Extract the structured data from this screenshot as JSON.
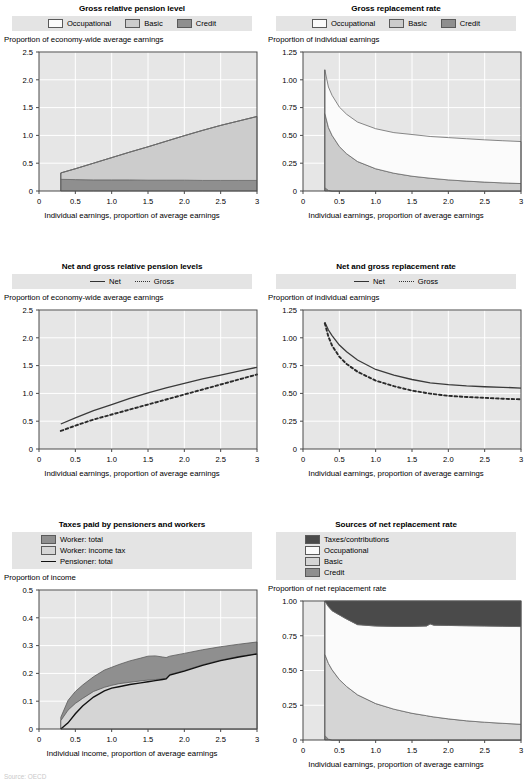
{
  "colors": {
    "legend_bg": "#e4e4e4",
    "plot_bg": "#e6e6e6",
    "gridline": "#ffffff",
    "axis": "#4a4a4a",
    "occupational": "#fbfbfb",
    "basic": "#cccccc",
    "credit": "#8f8f8f",
    "taxes_contributions": "#4a4a4a",
    "worker_total": "#8f8f8f",
    "worker_income_tax": "#d5d5d5",
    "pensioner_total": "#111111",
    "net_line": "#3a3a3a",
    "gross_line": "#2a2a2a"
  },
  "panels": [
    {
      "id": "gross-relative-pension-level",
      "title": "Gross relative pension level",
      "ylabel": "Proportion of economy-wide average earnings",
      "xlabel": "Individual earnings, proportion of average earnings",
      "legend": [
        {
          "label": "Occupational",
          "type": "swatch",
          "color": "#fbfbfb"
        },
        {
          "label": "Basic",
          "type": "swatch",
          "color": "#cccccc"
        },
        {
          "label": "Credit",
          "type": "swatch",
          "color": "#8f8f8f"
        }
      ],
      "chart_data": {
        "type": "area",
        "title": "Gross relative pension level",
        "xlabel": "Individual earnings, proportion of average earnings",
        "ylabel": "Proportion of economy-wide average earnings",
        "xlim": [
          0,
          3
        ],
        "ylim": [
          0,
          2.5
        ],
        "xticks": [
          0,
          0.5,
          1.0,
          1.5,
          2.0,
          2.5,
          3
        ],
        "xticklabels": [
          "0",
          "0.5",
          "1.0",
          "1.5",
          "2.0",
          "2.5",
          "3"
        ],
        "yticks": [
          0,
          0.5,
          1.0,
          1.5,
          2.0,
          2.5
        ],
        "yticklabels": [
          "0",
          "0.5",
          "1.0",
          "1.5",
          "2.0",
          "2.5"
        ],
        "grid": true,
        "stacked": true,
        "x": [
          0.3,
          0.5,
          0.75,
          1.0,
          1.25,
          1.5,
          1.75,
          2.0,
          2.25,
          2.5,
          2.75,
          3.0
        ],
        "series": [
          {
            "name": "Credit",
            "values": [
              0.21,
              0.205,
              0.2,
              0.2,
              0.2,
              0.195,
              0.195,
              0.195,
              0.19,
              0.19,
              0.19,
              0.19
            ]
          },
          {
            "name": "Basic",
            "values": [
              0.115,
              0.195,
              0.3,
              0.4,
              0.5,
              0.6,
              0.7,
              0.8,
              0.9,
              0.99,
              1.07,
              1.15
            ]
          },
          {
            "name": "Occupational",
            "values": [
              0,
              0,
              0,
              0,
              0,
              0,
              0,
              0,
              0,
              0,
              0,
              0
            ]
          }
        ],
        "totals": [
          0.325,
          0.4,
          0.5,
          0.6,
          0.7,
          0.795,
          0.895,
          0.995,
          1.09,
          1.18,
          1.26,
          1.34
        ]
      }
    },
    {
      "id": "gross-replacement-rate",
      "title": "Gross replacement rate",
      "ylabel": "Proportion of individual earnings",
      "xlabel": "Individual earnings, proportion of average earnings",
      "legend": [
        {
          "label": "Occupational",
          "type": "swatch",
          "color": "#fbfbfb"
        },
        {
          "label": "Basic",
          "type": "swatch",
          "color": "#cccccc"
        },
        {
          "label": "Credit",
          "type": "swatch",
          "color": "#8f8f8f"
        }
      ],
      "chart_data": {
        "type": "area",
        "title": "Gross replacement rate",
        "xlabel": "Individual earnings, proportion of average earnings",
        "ylabel": "Proportion of individual earnings",
        "xlim": [
          0,
          3
        ],
        "ylim": [
          0,
          1.25
        ],
        "xticks": [
          0,
          0.5,
          1.0,
          1.5,
          2.0,
          2.5,
          3
        ],
        "xticklabels": [
          "0",
          "0.5",
          "1.0",
          "1.5",
          "2.0",
          "2.5",
          "3"
        ],
        "yticks": [
          0,
          0.25,
          0.5,
          0.75,
          1.0,
          1.25
        ],
        "yticklabels": [
          "0",
          "0.25",
          "0.50",
          "0.75",
          "1.00",
          "1.25"
        ],
        "grid": true,
        "stacked": true,
        "x": [
          0.3,
          0.35,
          0.4,
          0.5,
          0.6,
          0.75,
          1.0,
          1.25,
          1.5,
          1.75,
          2.0,
          2.25,
          2.5,
          2.75,
          3.0
        ],
        "series": [
          {
            "name": "Credit",
            "values": [
              0.03,
              0.005,
              0.0,
              0.0,
              0.0,
              0.0,
              0.0,
              0.0,
              0.0,
              0.0,
              0.0,
              0.0,
              0.0,
              0.0,
              0.0
            ]
          },
          {
            "name": "Basic",
            "values": [
              0.67,
              0.565,
              0.5,
              0.4,
              0.335,
              0.265,
              0.2,
              0.16,
              0.133,
              0.115,
              0.1,
              0.089,
              0.08,
              0.073,
              0.067
            ]
          },
          {
            "name": "Occupational",
            "values": [
              0.39,
              0.365,
              0.36,
              0.355,
              0.355,
              0.355,
              0.36,
              0.365,
              0.375,
              0.375,
              0.38,
              0.381,
              0.38,
              0.379,
              0.378
            ]
          }
        ],
        "totals": [
          1.09,
          0.935,
          0.86,
          0.755,
          0.69,
          0.62,
          0.56,
          0.525,
          0.508,
          0.49,
          0.48,
          0.47,
          0.46,
          0.452,
          0.445
        ]
      }
    },
    {
      "id": "net-and-gross-relative-pension-levels",
      "title": "Net and gross relative pension levels",
      "ylabel": "Proportion of economy-wide average earnings",
      "xlabel": "Individual earnings, proportion of average earnings",
      "legend": [
        {
          "label": "Net",
          "type": "line",
          "color": "#3a3a3a"
        },
        {
          "label": "Gross",
          "type": "dash",
          "color": "#2a2a2a"
        }
      ],
      "chart_data": {
        "type": "line",
        "title": "Net and gross relative pension levels",
        "xlabel": "Individual earnings, proportion of average earnings",
        "ylabel": "Proportion of economy-wide average earnings",
        "xlim": [
          0,
          3
        ],
        "ylim": [
          0,
          2.5
        ],
        "xticks": [
          0,
          0.5,
          1.0,
          1.5,
          2.0,
          2.5,
          3
        ],
        "xticklabels": [
          "0",
          "0.5",
          "1.0",
          "1.5",
          "2.0",
          "2.5",
          "3"
        ],
        "yticks": [
          0,
          0.5,
          1.0,
          1.5,
          2.0,
          2.5
        ],
        "yticklabels": [
          "0",
          "0.5",
          "1.0",
          "1.5",
          "2.0",
          "2.5"
        ],
        "grid": true,
        "x": [
          0.3,
          0.5,
          0.75,
          1.0,
          1.25,
          1.5,
          1.75,
          2.0,
          2.25,
          2.5,
          2.75,
          3.0
        ],
        "series": [
          {
            "name": "Net",
            "values": [
              0.45,
              0.56,
              0.69,
              0.8,
              0.91,
              1.01,
              1.1,
              1.18,
              1.26,
              1.33,
              1.4,
              1.47
            ]
          },
          {
            "name": "Gross",
            "values": [
              0.325,
              0.42,
              0.53,
              0.62,
              0.71,
              0.8,
              0.89,
              0.98,
              1.07,
              1.16,
              1.25,
              1.34
            ]
          }
        ]
      }
    },
    {
      "id": "net-and-gross-replacement-rate",
      "title": "Net and gross replacement rate",
      "ylabel": "Proportion of individual earnings",
      "xlabel": "Individual earnings, proportion of average earnings",
      "legend": [
        {
          "label": "Net",
          "type": "line",
          "color": "#3a3a3a"
        },
        {
          "label": "Gross",
          "type": "dash",
          "color": "#2a2a2a"
        }
      ],
      "chart_data": {
        "type": "line",
        "title": "Net and gross replacement rate",
        "xlabel": "Individual earnings, proportion of average earnings",
        "ylabel": "Proportion of individual earnings",
        "xlim": [
          0,
          3
        ],
        "ylim": [
          0,
          1.25
        ],
        "xticks": [
          0,
          0.5,
          1.0,
          1.5,
          2.0,
          2.5,
          3
        ],
        "xticklabels": [
          "0",
          "0.5",
          "1.0",
          "1.5",
          "2.0",
          "2.5",
          "3"
        ],
        "yticks": [
          0,
          0.25,
          0.5,
          0.75,
          1.0,
          1.25
        ],
        "yticklabels": [
          "0",
          "0.25",
          "0.50",
          "0.75",
          "1.00",
          "1.25"
        ],
        "grid": true,
        "x": [
          0.3,
          0.35,
          0.4,
          0.5,
          0.6,
          0.75,
          1.0,
          1.25,
          1.5,
          1.75,
          2.0,
          2.25,
          2.5,
          2.75,
          3.0
        ],
        "series": [
          {
            "name": "Net",
            "values": [
              1.14,
              1.07,
              1.02,
              0.935,
              0.875,
              0.8,
              0.715,
              0.665,
              0.625,
              0.595,
              0.578,
              0.567,
              0.56,
              0.555,
              0.548
            ]
          },
          {
            "name": "Gross",
            "values": [
              1.13,
              1.01,
              0.93,
              0.83,
              0.765,
              0.695,
              0.615,
              0.565,
              0.525,
              0.498,
              0.478,
              0.468,
              0.46,
              0.452,
              0.447
            ]
          }
        ]
      }
    },
    {
      "id": "taxes-paid-by-pensioners-and-workers",
      "title": "Taxes paid by pensioners and workers",
      "ylabel": "Proportion of income",
      "xlabel": "Individual income, proportion of average earnings",
      "legend": [
        {
          "label": "Worker: total",
          "type": "swatch",
          "color": "#8f8f8f"
        },
        {
          "label": "Worker: income tax",
          "type": "swatch",
          "color": "#d5d5d5"
        },
        {
          "label": "Pensioner: total",
          "type": "line",
          "color": "#111111"
        }
      ],
      "chart_data": {
        "type": "area",
        "title": "Taxes paid by pensioners and workers",
        "xlabel": "Individual income, proportion of average earnings",
        "ylabel": "Proportion of income",
        "xlim": [
          0,
          3
        ],
        "ylim": [
          0,
          0.5
        ],
        "xticks": [
          0,
          0.5,
          1.0,
          1.5,
          2.0,
          2.5,
          3
        ],
        "xticklabels": [
          "0",
          "0.5",
          "1.0",
          "1.5",
          "2.0",
          "2.5",
          "3"
        ],
        "yticks": [
          0,
          0.1,
          0.2,
          0.3,
          0.4,
          0.5
        ],
        "yticklabels": [
          "0",
          "0.1",
          "0.2",
          "0.3",
          "0.4",
          "0.5"
        ],
        "grid": true,
        "x": [
          0.3,
          0.4,
          0.5,
          0.6,
          0.75,
          0.9,
          1.0,
          1.1,
          1.25,
          1.4,
          1.5,
          1.6,
          1.7,
          1.75,
          1.8,
          2.0,
          2.25,
          2.5,
          2.75,
          3.0
        ],
        "series": [
          {
            "name": "Worker: total",
            "values": [
              0.042,
              0.103,
              0.135,
              0.158,
              0.188,
              0.212,
              0.222,
              0.232,
              0.245,
              0.255,
              0.262,
              0.263,
              0.259,
              0.257,
              0.262,
              0.272,
              0.285,
              0.296,
              0.305,
              0.313
            ]
          },
          {
            "name": "Worker: income tax",
            "values": [
              0.03,
              0.068,
              0.092,
              0.11,
              0.135,
              0.15,
              0.157,
              0.163,
              0.168,
              0.173,
              0.176,
              0.178,
              0.18,
              0.182,
              0.196,
              0.21,
              0.231,
              0.248,
              0.261,
              0.271
            ]
          },
          {
            "name": "Pensioner: total",
            "values": [
              0.0,
              0.022,
              0.055,
              0.083,
              0.115,
              0.137,
              0.147,
              0.152,
              0.16,
              0.166,
              0.17,
              0.174,
              0.178,
              0.18,
              0.194,
              0.208,
              0.229,
              0.246,
              0.259,
              0.27
            ]
          }
        ]
      }
    },
    {
      "id": "sources-of-net-replacement-rate",
      "title": "Sources of net replacement rate",
      "ylabel": "Proportion of net replacement rate",
      "xlabel": "Individual earnings, proportion of average earnings",
      "legend": [
        {
          "label": "Taxes/contributions",
          "type": "swatch",
          "color": "#4a4a4a"
        },
        {
          "label": "Occupational",
          "type": "swatch",
          "color": "#fbfbfb"
        },
        {
          "label": "Basic",
          "type": "swatch",
          "color": "#d5d5d5"
        },
        {
          "label": "Credit",
          "type": "swatch",
          "color": "#8f8f8f"
        }
      ],
      "chart_data": {
        "type": "area",
        "title": "Sources of net replacement rate",
        "xlabel": "Individual earnings, proportion of average earnings",
        "ylabel": "Proportion of net replacement rate",
        "xlim": [
          0,
          3
        ],
        "ylim": [
          0,
          1.0
        ],
        "xticks": [
          0,
          0.5,
          1.0,
          1.5,
          2.0,
          2.5,
          3
        ],
        "xticklabels": [
          "0",
          "0.5",
          "1.0",
          "1.5",
          "2.0",
          "2.5",
          "3"
        ],
        "yticks": [
          0,
          0.25,
          0.5,
          0.75,
          1.0
        ],
        "yticklabels": [
          "0",
          "0.25",
          "0.50",
          "0.75",
          "1.00"
        ],
        "grid": true,
        "stacked": true,
        "x": [
          0.3,
          0.35,
          0.4,
          0.5,
          0.6,
          0.75,
          1.0,
          1.25,
          1.5,
          1.7,
          1.75,
          1.8,
          2.0,
          2.25,
          2.5,
          2.75,
          3.0
        ],
        "series": [
          {
            "name": "Credit",
            "values": [
              0.032,
              0.006,
              0.0,
              0.0,
              0.0,
              0.0,
              0.0,
              0.0,
              0.0,
              0.0,
              0.0,
              0.0,
              0.0,
              0.0,
              0.0,
              0.0,
              0.0
            ]
          },
          {
            "name": "Basic",
            "values": [
              0.585,
              0.545,
              0.505,
              0.435,
              0.385,
              0.325,
              0.262,
              0.222,
              0.192,
              0.175,
              0.17,
              0.166,
              0.152,
              0.138,
              0.128,
              0.12,
              0.113
            ]
          },
          {
            "name": "Occupational",
            "values": [
              0.383,
              0.409,
              0.425,
              0.465,
              0.485,
              0.505,
              0.558,
              0.595,
              0.625,
              0.645,
              0.665,
              0.66,
              0.672,
              0.684,
              0.692,
              0.698,
              0.703
            ]
          },
          {
            "name": "Taxes/contributions",
            "values": [
              0.0,
              0.04,
              0.07,
              0.1,
              0.13,
              0.17,
              0.18,
              0.183,
              0.183,
              0.18,
              0.165,
              0.174,
              0.176,
              0.178,
              0.18,
              0.182,
              0.184
            ]
          }
        ]
      }
    }
  ],
  "footnote": "Source: OECD"
}
